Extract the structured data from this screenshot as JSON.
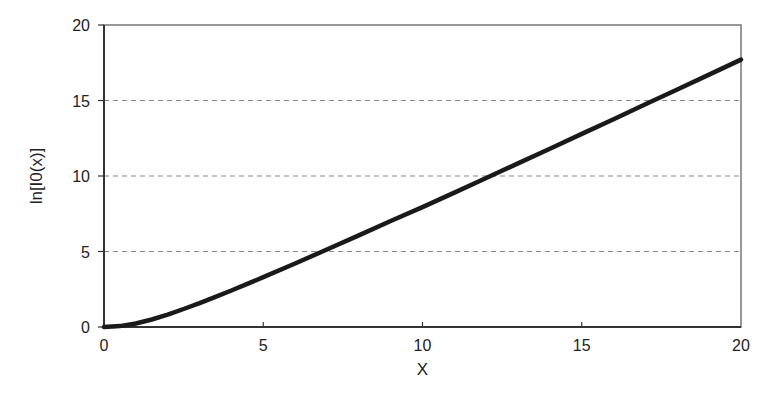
{
  "chart_data": {
    "type": "line",
    "title": "",
    "xlabel": "X",
    "ylabel": "ln[I0(x)]",
    "xlim": [
      0,
      20
    ],
    "ylim": [
      0,
      20
    ],
    "x_ticks": [
      0,
      5,
      10,
      15,
      20
    ],
    "y_ticks": [
      0,
      5,
      10,
      15,
      20
    ],
    "x_tick_labels": [
      "0",
      "5",
      "10",
      "15",
      "20"
    ],
    "y_tick_labels": [
      "0",
      "5",
      "10",
      "15",
      "20"
    ],
    "grid": {
      "horizontal": true,
      "vertical": false,
      "style": "dashed",
      "at_y": [
        5,
        10,
        15
      ]
    },
    "legend": null,
    "series": [
      {
        "name": "ln[I0(x)]",
        "color": "#1a1a1a",
        "x": [
          0,
          0.5,
          1,
          1.5,
          2,
          2.5,
          3,
          3.5,
          4,
          4.5,
          5,
          6,
          7,
          8,
          9,
          10,
          11,
          12,
          13,
          14,
          15,
          16,
          17,
          18,
          19,
          20
        ],
        "y": [
          0,
          0.062,
          0.235,
          0.494,
          0.824,
          1.192,
          1.586,
          1.998,
          2.418,
          2.856,
          3.3,
          4.204,
          5.13,
          6.068,
          7.018,
          7.943,
          8.902,
          9.866,
          10.835,
          11.808,
          12.785,
          13.764,
          14.746,
          15.731,
          16.718,
          17.706
        ]
      }
    ]
  },
  "colors": {
    "axis": "#333333",
    "frame": "#777777",
    "grid": "#888888",
    "line": "#1a1a1a",
    "background": "#ffffff"
  }
}
